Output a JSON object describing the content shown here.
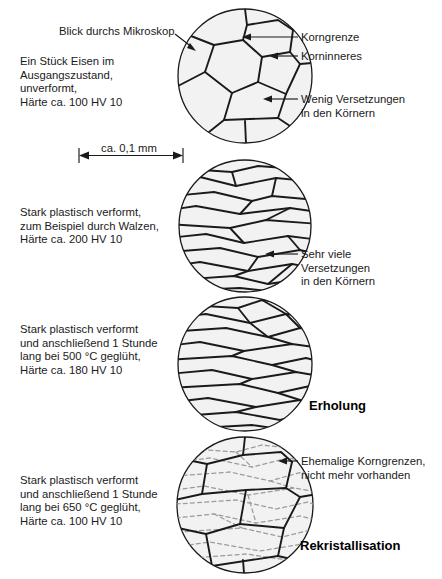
{
  "figure": {
    "type": "microstructure-diagram",
    "language": "de",
    "fill_color": "#ececec",
    "line_color": "#1a1a1a",
    "old_boundary_color": "#9b9b9b"
  },
  "scalebar": {
    "label": "ca. 0,1 mm"
  },
  "callouts": {
    "microscope_view": "Blick durchs Mikroskop",
    "grain_boundary": "Korngrenze",
    "grain_interior": "Korninneres",
    "few_dislocations_l1": "Wenig Versetzungen",
    "few_dislocations_l2": "in den Körnern",
    "many_dislocations_l1": "Sehr viele",
    "many_dislocations_l2": "Versetzungen",
    "many_dislocations_l3": "in den Körnern",
    "former_boundaries_l1": "Ehemalige Korngrenzen,",
    "former_boundaries_l2": "nicht mehr vorhanden"
  },
  "panels": [
    {
      "id": "panel-1-undeformed",
      "description_lines": [
        "Ein Stück Eisen im",
        "Ausgangszustand,",
        "unverformt,",
        "Härte ca. 100 HV 10"
      ],
      "hardness": "100 HV 10",
      "stage_label": ""
    },
    {
      "id": "panel-2-deformed",
      "description_lines": [
        "Stark plastisch verformt,",
        "zum Beispiel durch Walzen,",
        "Härte ca. 200 HV 10"
      ],
      "hardness": "200 HV 10",
      "stage_label": ""
    },
    {
      "id": "panel-3-recovery",
      "description_lines": [
        "Stark plastisch verformt",
        "und anschließend 1 Stunde",
        "lang bei 500 °C geglüht,",
        "Härte ca. 180 HV 10"
      ],
      "hardness": "180 HV 10",
      "temperature": "500 °C",
      "stage_label": "Erholung"
    },
    {
      "id": "panel-4-recrystallisation",
      "description_lines": [
        "Stark plastisch verformt",
        "und anschließend 1 Stunde",
        "lang bei 650 °C geglüht,",
        "Härte ca. 100 HV 10"
      ],
      "hardness": "100 HV 10",
      "temperature": "650 °C",
      "stage_label": "Rekristallisation"
    }
  ]
}
